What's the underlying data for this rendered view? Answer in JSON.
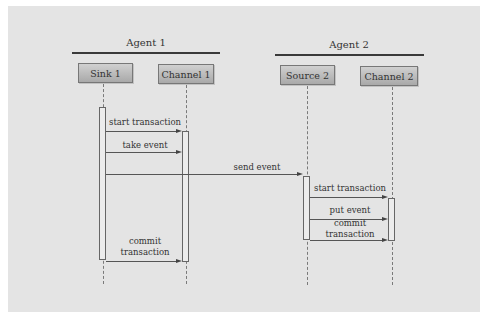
{
  "diagram": {
    "type": "sequence",
    "groups": [
      {
        "id": "agent1",
        "label": "Agent 1",
        "participants": [
          "sink1",
          "channel1"
        ]
      },
      {
        "id": "agent2",
        "label": "Agent 2",
        "participants": [
          "source2",
          "channel2"
        ]
      }
    ],
    "participants": {
      "sink1": {
        "label": "Sink 1"
      },
      "channel1": {
        "label": "Channel 1"
      },
      "source2": {
        "label": "Source 2"
      },
      "channel2": {
        "label": "Channel 2"
      }
    },
    "messages": [
      {
        "from": "sink1",
        "to": "channel1",
        "label": "start transaction"
      },
      {
        "from": "sink1",
        "to": "channel1",
        "label": "take event"
      },
      {
        "from": "sink1",
        "to": "source2",
        "label": "send event"
      },
      {
        "from": "source2",
        "to": "channel2",
        "label": "start transaction"
      },
      {
        "from": "source2",
        "to": "channel2",
        "label": "put event"
      },
      {
        "from": "source2",
        "to": "channel2",
        "label_line1": "commit",
        "label_line2": "transaction"
      },
      {
        "from": "sink1",
        "to": "channel1",
        "label_line1": "commit",
        "label_line2": "transaction"
      }
    ]
  },
  "colors": {
    "background": "#e4e4e4",
    "participant_fill_top": "#d0d0d0",
    "participant_fill_bottom": "#a9a9a9",
    "line": "#555555"
  }
}
